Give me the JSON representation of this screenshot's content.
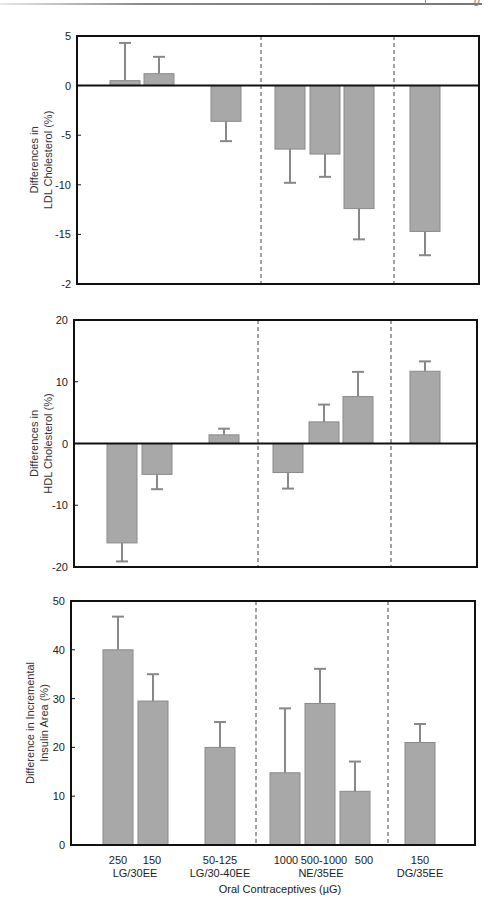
{
  "page": {
    "header_fragment": "g"
  },
  "colors": {
    "bar_fill": "#a8a8a8",
    "bar_stroke": "#8a8a8a",
    "error_bar": "#888888",
    "axis": "#111111",
    "divider": "#444444"
  },
  "x_axis": {
    "dose_labels": [
      "250",
      "150",
      "50-125",
      "1000",
      "500-1000",
      "500",
      "150"
    ],
    "group_labels": [
      "LG/30EE",
      "LG/30-40EE",
      "NE/35EE",
      "DG/35EE"
    ],
    "title": "Oral Contraceptives (µG)"
  },
  "chart_data": [
    {
      "type": "bar",
      "title": "",
      "ylabel": "Differences in LDL Cholesterol (%)",
      "ylabel_lines": [
        "Differences in",
        "LDL Cholesterol (%)"
      ],
      "xlabel": "",
      "ylim": [
        -20,
        5
      ],
      "yticks": [
        5,
        0,
        -5,
        -10,
        -15,
        -20
      ],
      "ytick_labels": [
        "5",
        "0",
        "-5",
        "-10",
        "-15",
        "-2"
      ],
      "grid": false,
      "categories": [
        "LG/30EE 250",
        "LG/30EE 150",
        "LG/30-40EE 50-125",
        "NE/35EE 1000",
        "NE/35EE 500-1000",
        "NE/35EE 500",
        "DG/35EE 150"
      ],
      "values": [
        0.5,
        1.2,
        -3.6,
        -6.4,
        -6.9,
        -12.4,
        -14.7
      ],
      "error_ends": [
        4.3,
        2.9,
        -5.6,
        -9.8,
        -9.2,
        -15.5,
        -17.1
      ],
      "group_dividers_after": [
        2,
        5
      ]
    },
    {
      "type": "bar",
      "title": "",
      "ylabel": "Differences in HDL Cholesterol (%)",
      "ylabel_lines": [
        "Differences in",
        "HDL Cholesterol (%)"
      ],
      "xlabel": "",
      "ylim": [
        -20,
        20
      ],
      "yticks": [
        20,
        10,
        0,
        -10,
        -20
      ],
      "ytick_labels": [
        "20",
        "10",
        "0",
        "-10",
        "-20"
      ],
      "grid": false,
      "categories": [
        "LG/30EE 250",
        "LG/30EE 150",
        "LG/30-40EE 50-125",
        "NE/35EE 1000",
        "NE/35EE 500-1000",
        "NE/35EE 500",
        "DG/35EE 150"
      ],
      "values": [
        -16.1,
        -5.0,
        1.4,
        -4.7,
        3.5,
        7.6,
        11.7
      ],
      "error_ends": [
        -19.1,
        -7.4,
        2.4,
        -7.3,
        6.3,
        11.6,
        13.3
      ],
      "group_dividers_after": [
        2,
        5
      ]
    },
    {
      "type": "bar",
      "title": "",
      "ylabel": "Difference in Incremental Insulin Area (%)",
      "ylabel_lines": [
        "Difference in Incremental",
        "Insulin Area (%)"
      ],
      "xlabel": "Oral Contraceptives (µG)",
      "ylim": [
        0,
        50
      ],
      "yticks": [
        50,
        40,
        30,
        20,
        10,
        0
      ],
      "ytick_labels": [
        "50",
        "40",
        "30",
        "20",
        "10",
        "0"
      ],
      "grid": false,
      "categories": [
        "LG/30EE 250",
        "LG/30EE 150",
        "LG/30-40EE 50-125",
        "NE/35EE 1000",
        "NE/35EE 500-1000",
        "NE/35EE 500",
        "DG/35EE 150"
      ],
      "values": [
        40.0,
        29.5,
        20.0,
        14.8,
        29.0,
        11.0,
        21.0
      ],
      "error_ends": [
        46.8,
        35.0,
        25.2,
        28.0,
        36.1,
        17.1,
        24.8
      ],
      "group_dividers_after": [
        2,
        5
      ]
    }
  ]
}
